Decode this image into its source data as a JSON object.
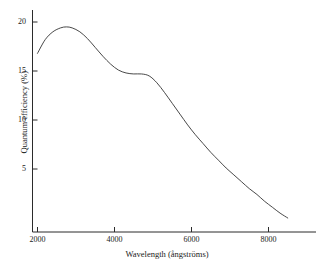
{
  "chart_data": {
    "type": "line",
    "title": "",
    "xlabel": "Wavelength (ångströms)",
    "ylabel": "Quantum efficiency (%)",
    "xlim": [
      1700,
      8900
    ],
    "ylim": [
      0,
      21.5
    ],
    "grid": false,
    "legend": null,
    "xticks": [
      2000,
      4000,
      6000,
      8000
    ],
    "xtick_labels": [
      "2000",
      "4000",
      "6000",
      "8000"
    ],
    "yticks": [
      5,
      10,
      15,
      20
    ],
    "ytick_labels": [
      "5",
      "10",
      "15",
      "20"
    ],
    "series": [
      {
        "name": "Quantum efficiency",
        "color": "#333333",
        "x": [
          2000,
          2200,
          2400,
          2600,
          2750,
          2900,
          3100,
          3300,
          3500,
          3700,
          3900,
          4100,
          4300,
          4500,
          4700,
          4900,
          5100,
          5300,
          5500,
          5700,
          5900,
          6100,
          6300,
          6500,
          6700,
          6900,
          7100,
          7300,
          7500,
          7700,
          7900,
          8100,
          8300,
          8500
        ],
        "y": [
          16.8,
          18.2,
          19.0,
          19.4,
          19.5,
          19.4,
          19.0,
          18.3,
          17.4,
          16.5,
          15.7,
          15.1,
          14.8,
          14.7,
          14.7,
          14.5,
          13.8,
          12.8,
          11.7,
          10.6,
          9.5,
          8.5,
          7.6,
          6.7,
          5.9,
          5.1,
          4.4,
          3.7,
          3.0,
          2.4,
          1.7,
          1.1,
          0.5,
          0.0
        ]
      }
    ]
  },
  "axes": {
    "x_title": "Wavelength (ångströms)",
    "y_title": "Quantum efficiency (%)",
    "x_tick_labels": [
      "2000",
      "4000",
      "6000",
      "8000"
    ],
    "y_tick_labels": [
      "20",
      "15",
      "10",
      "5"
    ]
  }
}
